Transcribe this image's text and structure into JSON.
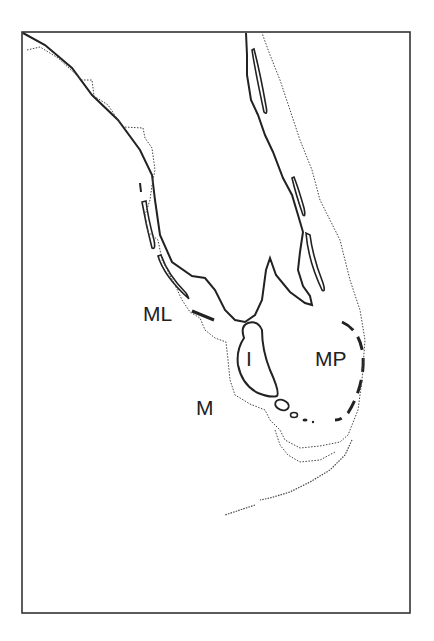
{
  "map": {
    "frame": {
      "stroke": "#333333"
    },
    "labels": [
      {
        "id": "ML",
        "text": "ML",
        "x": 143,
        "y": 303
      },
      {
        "id": "I",
        "text": "I",
        "x": 246,
        "y": 348
      },
      {
        "id": "MP",
        "text": "MP",
        "x": 315,
        "y": 348
      },
      {
        "id": "M",
        "text": "M",
        "x": 196,
        "y": 397
      }
    ],
    "legend": {
      "solid_line": "formation boundary",
      "dotted_line": "modern coastline"
    },
    "colors": {
      "line": "#222222",
      "coast": "#444444",
      "background": "#ffffff"
    }
  }
}
